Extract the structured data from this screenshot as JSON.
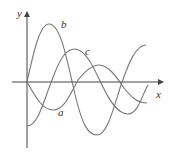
{
  "figure": {
    "axes": {
      "x_label": "x",
      "y_label": "y"
    },
    "curves": [
      {
        "name": "a",
        "label": "a",
        "description": "starts at origin, dips first, then oscillates"
      },
      {
        "name": "b",
        "label": "b",
        "description": "largest amplitude, rises from origin to a tall peak"
      },
      {
        "name": "c",
        "label": "c",
        "description": "starts below origin, rises to a middle peak"
      }
    ],
    "colors": {
      "axis": "#444444",
      "curve": "#777777",
      "background": "#ffffff"
    }
  }
}
